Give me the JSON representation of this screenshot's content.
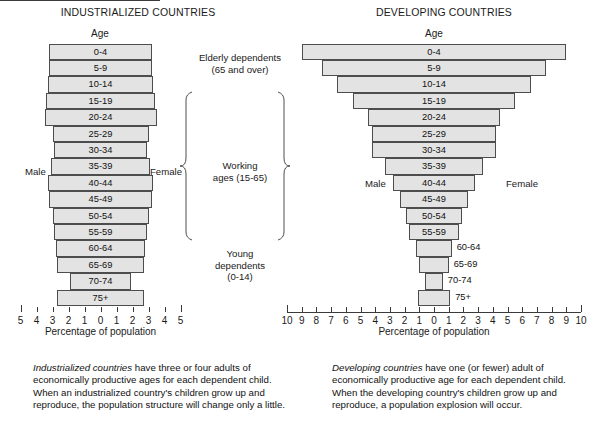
{
  "chart_data": {
    "type": "bar",
    "xlabel": "Percentage of population",
    "ylabel": "Age",
    "grid": false,
    "legend": [
      "Male",
      "Female"
    ],
    "charts": [
      {
        "name": "industrialized",
        "title": "INDUSTRIALIZED COUNTRIES",
        "axis_label": "Percentage of population",
        "age_label": "Age",
        "male_label": "Male",
        "female_label": "Female",
        "xlim": [
          -5,
          5
        ],
        "ticks": [
          "5",
          "4",
          "3",
          "2",
          "1",
          "0",
          "1",
          "2",
          "3",
          "4",
          "5"
        ],
        "categories": [
          "0-4",
          "5-9",
          "10-14",
          "15-19",
          "20-24",
          "25-29",
          "30-34",
          "35-39",
          "40-44",
          "45-49",
          "50-54",
          "55-59",
          "60-64",
          "65-69",
          "70-74",
          "75+"
        ],
        "male_values": [
          3.2,
          3.2,
          3.3,
          3.4,
          3.5,
          3.0,
          2.9,
          3.1,
          3.3,
          3.2,
          3.0,
          2.9,
          2.8,
          2.7,
          1.9,
          2.7
        ],
        "female_values": [
          3.2,
          3.2,
          3.3,
          3.4,
          3.5,
          3.0,
          2.9,
          3.1,
          3.3,
          3.2,
          3.0,
          2.9,
          2.8,
          2.7,
          1.9,
          2.7
        ]
      },
      {
        "name": "developing",
        "title": "DEVELOPING COUNTRIES",
        "axis_label": "Percentage of population",
        "age_label": "Age",
        "male_label": "Male",
        "female_label": "Female",
        "xlim": [
          -10,
          10
        ],
        "ticks": [
          "10",
          "9",
          "8",
          "7",
          "6",
          "5",
          "4",
          "3",
          "2",
          "1",
          "0",
          "1",
          "2",
          "3",
          "4",
          "5",
          "6",
          "7",
          "8",
          "9",
          "10"
        ],
        "categories": [
          "0-4",
          "5-9",
          "10-14",
          "15-19",
          "20-24",
          "25-29",
          "30-34",
          "35-39",
          "40-44",
          "45-49",
          "50-54",
          "55-59",
          "60-64",
          "65-69",
          "70-74",
          "75+"
        ],
        "male_values": [
          9.0,
          7.6,
          6.6,
          5.5,
          4.5,
          4.2,
          4.2,
          3.3,
          2.8,
          2.3,
          1.9,
          1.7,
          1.2,
          1.0,
          0.6,
          1.1
        ],
        "female_values": [
          9.0,
          7.6,
          6.6,
          5.5,
          4.5,
          4.2,
          4.2,
          3.3,
          2.8,
          2.3,
          1.9,
          1.7,
          1.2,
          1.0,
          0.6,
          1.1
        ]
      }
    ]
  },
  "left": {
    "title": "INDUSTRIALIZED COUNTRIES",
    "age_label": "Age",
    "male_label": "Male",
    "female_label": "Female",
    "axis_caption": "Percentage of population",
    "caption_italic": "Industrialized countries",
    "caption_rest": " have three or four adults of economically productive ages for each dependent child. When an industrialized country's children grow up and reproduce, the population structure will change only a little."
  },
  "right": {
    "title": "DEVELOPING COUNTRIES",
    "age_label": "Age",
    "male_label": "Male",
    "female_label": "Female",
    "axis_caption": "Percentage of population",
    "caption_italic": "Developing countries",
    "caption_rest": " have one (or fewer) adult of economically productive age for each dependent child. When the developing country's children grow up and reproduce, a population explosion will occur."
  },
  "annotations": {
    "elderly_line1": "Elderly dependents",
    "elderly_line2": "(65 and over)",
    "working_line1": "Working",
    "working_line2": "ages (15-65)",
    "young_line1": "Young",
    "young_line2": "dependents",
    "young_line3": "(0-14)"
  },
  "colors": {
    "bar_fill": "#e3e3e3",
    "bar_stroke": "#4d4d4d",
    "text": "#111111",
    "axis": "#3a3a3a"
  }
}
